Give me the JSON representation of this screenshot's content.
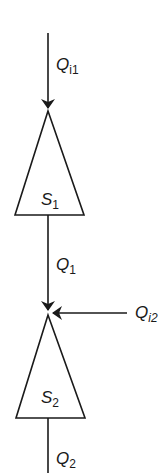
{
  "diagram": {
    "type": "flow-schematic",
    "nodes": [
      {
        "id": "S1",
        "symbol": "S",
        "subscript": "1"
      },
      {
        "id": "S2",
        "symbol": "S",
        "subscript": "2"
      }
    ],
    "flows": [
      {
        "id": "Qi1",
        "symbol": "Q",
        "subscript": "i1",
        "from": "external-top",
        "to": "S1"
      },
      {
        "id": "Q1",
        "symbol": "Q",
        "subscript": "1",
        "from": "S1",
        "to": "S2"
      },
      {
        "id": "Qi2",
        "symbol": "Q",
        "subscript": "i2",
        "from": "external-right",
        "to": "S2"
      },
      {
        "id": "Q2",
        "symbol": "Q",
        "subscript": "2",
        "from": "S2",
        "to": "external-bottom"
      }
    ],
    "colors": {
      "stroke": "#1a1a1a",
      "background": "#ffffff"
    }
  }
}
